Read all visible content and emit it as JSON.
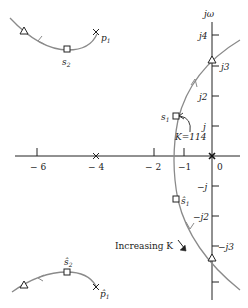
{
  "diagram": {
    "type": "root-locus",
    "axes": {
      "imag_label": "jω",
      "real_ticks": [
        {
          "value": -6,
          "label": "− 6"
        },
        {
          "value": -4,
          "label": "− 4"
        },
        {
          "value": -2,
          "label": "− 2"
        },
        {
          "value": -1,
          "label": "−1"
        },
        {
          "value": 0,
          "label": "0"
        }
      ],
      "imag_ticks": [
        {
          "value": 4,
          "label": "j4"
        },
        {
          "value": 3,
          "label": "j3"
        },
        {
          "value": 2,
          "label": "j2"
        },
        {
          "value": 1,
          "label": "j"
        },
        {
          "value": -1,
          "label": "−j"
        },
        {
          "value": -2,
          "label": "−j2"
        },
        {
          "value": -3,
          "label": "−j3"
        }
      ]
    },
    "labels": {
      "p1": "p",
      "p1_sub": "1",
      "p1_hat": "p̂",
      "s2": "s",
      "s2_sub": "2",
      "s2_hat": "ŝ",
      "s1": "s",
      "s1_sub": "1",
      "s1_hat": "ŝ",
      "gain_annotation": "K=114",
      "increasing_k": "Increasing K"
    },
    "colors": {
      "locus": "#8a8a8a",
      "axis": "#222222"
    }
  }
}
